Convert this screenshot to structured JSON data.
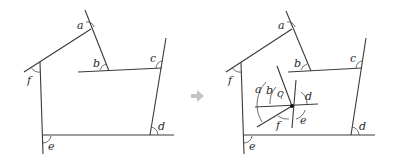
{
  "figure": {
    "left": {
      "labels": {
        "a": "a",
        "b": "b",
        "c": "c",
        "d": "d",
        "e": "e",
        "f": "f"
      }
    },
    "arrow": {
      "color": "#bdbdbd"
    },
    "right": {
      "labels": {
        "a": "a",
        "b": "b",
        "c": "c",
        "d": "d",
        "e": "e",
        "f": "f"
      },
      "center_labels": {
        "a": "a",
        "b": "b",
        "c": "c",
        "d": "d",
        "e": "e",
        "f": "f"
      }
    }
  }
}
